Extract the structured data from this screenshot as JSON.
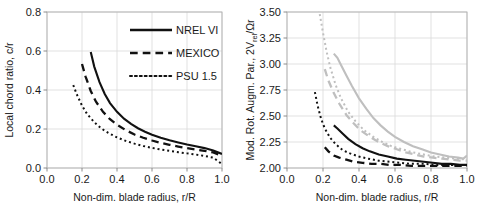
{
  "figure": {
    "name": "two-panel-line-chart",
    "background": "#ffffff",
    "panels": [
      "left",
      "right"
    ]
  },
  "chart_data": [
    {
      "id": "left",
      "type": "line",
      "title": "",
      "xlabel": "Non-dim. blade radius, r/R",
      "ylabel": "Local chord ratio, c/r",
      "xlim": [
        0.0,
        1.0
      ],
      "ylim": [
        0.0,
        0.8
      ],
      "xticks": [
        "0.0",
        "0.2",
        "0.4",
        "0.6",
        "0.8",
        "1.0"
      ],
      "yticks": [
        "0.0",
        "0.2",
        "0.4",
        "0.6",
        "0.8"
      ],
      "xtick_values": [
        0.0,
        0.2,
        0.4,
        0.6,
        0.8,
        1.0
      ],
      "ytick_values": [
        0.0,
        0.2,
        0.4,
        0.6,
        0.8
      ],
      "grid": true,
      "legend_position": "top-right",
      "legend": [
        {
          "label": "NREL VI",
          "style": "solid",
          "color": "#111111"
        },
        {
          "label": "MEXICO",
          "style": "dashed",
          "color": "#111111"
        },
        {
          "label": "PSU 1.5",
          "style": "dotted",
          "color": "#111111"
        }
      ],
      "series": [
        {
          "name": "NREL VI",
          "style": "solid",
          "color": "#111111",
          "x": [
            0.25,
            0.27,
            0.3,
            0.33,
            0.36,
            0.4,
            0.44,
            0.48,
            0.52,
            0.56,
            0.6,
            0.65,
            0.7,
            0.75,
            0.8,
            0.85,
            0.9,
            0.95,
            1.0
          ],
          "y": [
            0.595,
            0.52,
            0.44,
            0.38,
            0.333,
            0.288,
            0.253,
            0.226,
            0.204,
            0.186,
            0.171,
            0.155,
            0.142,
            0.131,
            0.121,
            0.112,
            0.102,
            0.09,
            0.072
          ]
        },
        {
          "name": "MEXICO",
          "style": "dashed",
          "color": "#111111",
          "x": [
            0.2,
            0.22,
            0.25,
            0.28,
            0.32,
            0.36,
            0.4,
            0.45,
            0.5,
            0.55,
            0.6,
            0.65,
            0.7,
            0.75,
            0.8,
            0.85,
            0.9,
            0.95,
            1.0
          ],
          "y": [
            0.533,
            0.47,
            0.395,
            0.34,
            0.288,
            0.25,
            0.222,
            0.194,
            0.172,
            0.155,
            0.141,
            0.129,
            0.119,
            0.11,
            0.102,
            0.095,
            0.088,
            0.08,
            0.062
          ]
        },
        {
          "name": "PSU 1.5",
          "style": "dotted",
          "color": "#111111",
          "x": [
            0.15,
            0.17,
            0.2,
            0.23,
            0.27,
            0.31,
            0.35,
            0.4,
            0.45,
            0.5,
            0.55,
            0.6,
            0.65,
            0.7,
            0.75,
            0.8,
            0.85,
            0.9,
            0.95,
            1.0
          ],
          "y": [
            0.425,
            0.378,
            0.32,
            0.276,
            0.235,
            0.203,
            0.18,
            0.157,
            0.139,
            0.125,
            0.113,
            0.103,
            0.095,
            0.088,
            0.081,
            0.075,
            0.069,
            0.062,
            0.053,
            0.02
          ]
        }
      ]
    },
    {
      "id": "right",
      "type": "line",
      "title": "",
      "xlabel": "Non-dim. blade radius, r/R",
      "ylabel": "Mod. Rot. Augm. Par., 2V",
      "ylabel_sub": "rel",
      "ylabel_tail": "/Ωr",
      "xlim": [
        0.0,
        1.0
      ],
      "ylim": [
        2.0,
        3.5
      ],
      "xticks": [
        "0.0",
        "0.2",
        "0.4",
        "0.6",
        "0.8",
        "1.0"
      ],
      "yticks": [
        "2.00",
        "2.25",
        "2.50",
        "2.75",
        "3.00",
        "3.25",
        "3.50"
      ],
      "xtick_values": [
        0.0,
        0.2,
        0.4,
        0.6,
        0.8,
        1.0
      ],
      "ytick_values": [
        2.0,
        2.25,
        2.5,
        2.75,
        3.0,
        3.25,
        3.5
      ],
      "grid": true,
      "legend_position": "none",
      "legend": [],
      "series": [
        {
          "name": "NREL VI (gray)",
          "style": "solid",
          "color": "#bfbfbf",
          "x": [
            0.26,
            0.28,
            0.3,
            0.33,
            0.36,
            0.4,
            0.44,
            0.48,
            0.52,
            0.56,
            0.6,
            0.65,
            0.7,
            0.75,
            0.8,
            0.85,
            0.9,
            0.95,
            0.98,
            1.0
          ],
          "y": [
            3.1,
            3.06,
            2.99,
            2.89,
            2.79,
            2.67,
            2.57,
            2.48,
            2.41,
            2.35,
            2.3,
            2.25,
            2.21,
            2.18,
            2.15,
            2.13,
            2.11,
            2.1,
            2.09,
            2.12
          ]
        },
        {
          "name": "MEXICO (gray)",
          "style": "dashed",
          "color": "#bfbfbf",
          "x": [
            0.21,
            0.23,
            0.26,
            0.29,
            0.33,
            0.37,
            0.41,
            0.46,
            0.51,
            0.56,
            0.61,
            0.66,
            0.71,
            0.76,
            0.81,
            0.86,
            0.91,
            0.96,
            1.0
          ],
          "y": [
            2.95,
            2.84,
            2.72,
            2.62,
            2.51,
            2.43,
            2.36,
            2.3,
            2.25,
            2.21,
            2.18,
            2.15,
            2.13,
            2.11,
            2.1,
            2.09,
            2.08,
            2.07,
            2.07
          ]
        },
        {
          "name": "PSU 1.5 (gray)",
          "style": "dotted",
          "color": "#bfbfbf",
          "x": [
            0.17,
            0.18,
            0.2,
            0.22,
            0.24,
            0.27,
            0.3,
            0.34,
            0.38,
            0.43,
            0.48,
            0.53,
            0.58,
            0.64,
            0.7,
            0.76,
            0.82,
            0.88,
            0.94,
            1.0
          ],
          "y": [
            3.62,
            3.5,
            3.3,
            3.12,
            2.97,
            2.8,
            2.67,
            2.54,
            2.45,
            2.36,
            2.3,
            2.25,
            2.21,
            2.18,
            2.15,
            2.13,
            2.11,
            2.1,
            2.09,
            2.08
          ]
        },
        {
          "name": "NREL VI (black)",
          "style": "solid",
          "color": "#111111",
          "x": [
            0.26,
            0.28,
            0.31,
            0.34,
            0.38,
            0.42,
            0.46,
            0.51,
            0.56,
            0.61,
            0.66,
            0.71,
            0.76,
            0.81,
            0.86,
            0.91,
            0.96,
            1.0
          ],
          "y": [
            2.41,
            2.38,
            2.33,
            2.28,
            2.23,
            2.19,
            2.16,
            2.13,
            2.11,
            2.09,
            2.08,
            2.07,
            2.06,
            2.05,
            2.04,
            2.04,
            2.03,
            2.03
          ]
        },
        {
          "name": "MEXICO (black)",
          "style": "dashed",
          "color": "#111111",
          "x": [
            0.21,
            0.23,
            0.26,
            0.29,
            0.33,
            0.37,
            0.42,
            0.47,
            0.52,
            0.57,
            0.63,
            0.69,
            0.75,
            0.81,
            0.87,
            0.93,
            1.0
          ],
          "y": [
            2.2,
            2.16,
            2.12,
            2.1,
            2.08,
            2.06,
            2.05,
            2.04,
            2.04,
            2.03,
            2.03,
            2.02,
            2.02,
            2.02,
            2.02,
            2.02,
            2.02
          ]
        },
        {
          "name": "PSU 1.5 (black)",
          "style": "dotted",
          "color": "#111111",
          "x": [
            0.155,
            0.17,
            0.19,
            0.21,
            0.24,
            0.27,
            0.31,
            0.35,
            0.4,
            0.45,
            0.51,
            0.57,
            0.63,
            0.69,
            0.76,
            0.83,
            0.9,
            1.0
          ],
          "y": [
            2.73,
            2.6,
            2.47,
            2.38,
            2.29,
            2.23,
            2.17,
            2.14,
            2.11,
            2.09,
            2.07,
            2.06,
            2.05,
            2.04,
            2.04,
            2.03,
            2.03,
            2.03
          ]
        }
      ]
    }
  ]
}
